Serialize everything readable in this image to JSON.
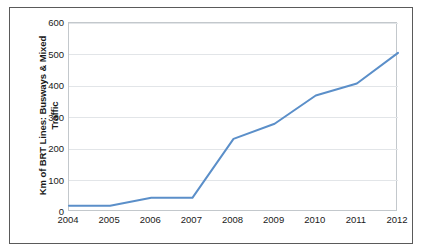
{
  "chart_data": {
    "type": "line",
    "title": "",
    "xlabel": "",
    "ylabel": "Km of BRT Lines: Busways & Mixed\nTraffic",
    "ylabel_line1": "Km of BRT Lines: Busways & Mixed",
    "ylabel_line2": "Traffic",
    "categories": [
      "2004",
      "2005",
      "2006",
      "2007",
      "2008",
      "2009",
      "2010",
      "2011",
      "2012"
    ],
    "x": [
      2004,
      2005,
      2006,
      2007,
      2008,
      2009,
      2010,
      2011,
      2012
    ],
    "values": [
      20,
      20,
      45,
      45,
      232,
      280,
      370,
      408,
      505
    ],
    "series": [
      {
        "name": "Km of BRT Lines: Busways & Mixed Traffic",
        "values": [
          20,
          20,
          45,
          45,
          232,
          280,
          370,
          408,
          505
        ],
        "color": "#5B8FC9"
      }
    ],
    "ylim": [
      0,
      600
    ],
    "xlim": [
      2004,
      2012
    ],
    "yticks": [
      0,
      100,
      200,
      300,
      400,
      500,
      600
    ],
    "ytick_labels": [
      "0",
      "100",
      "200",
      "300",
      "400",
      "500",
      "600"
    ],
    "xtick_labels": [
      "2004",
      "2005",
      "2006",
      "2007",
      "2008",
      "2009",
      "2010",
      "2011",
      "2012"
    ],
    "grid": "horizontal",
    "legend": "none",
    "line_color": "#5B8FC9",
    "gridline_color": "#E2E5E8",
    "plot_border_color": "#C3C8CC",
    "frame_border_color": "#5A5A5A",
    "background": "#FFFFFF",
    "markers": false
  }
}
